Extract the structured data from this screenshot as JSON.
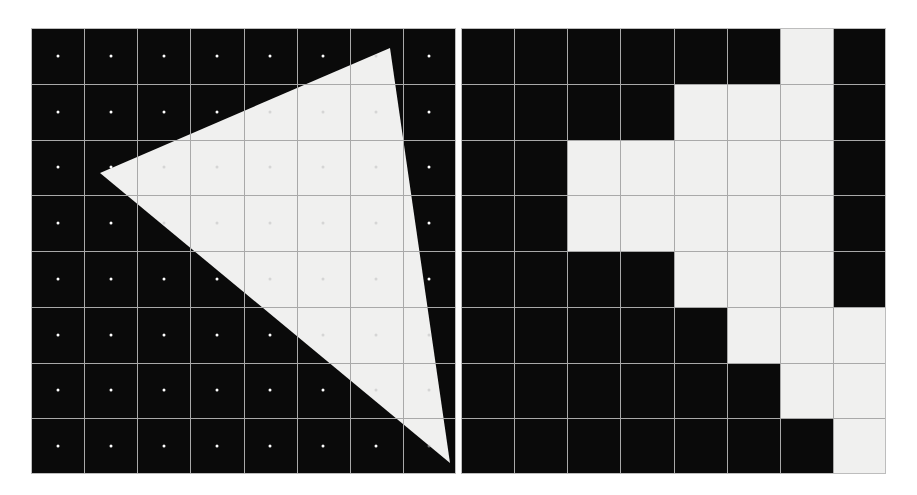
{
  "figure": {
    "width": 917,
    "height": 495,
    "background_color": "#ffffff"
  },
  "colors": {
    "cell_off": "#0a0a0a",
    "cell_on": "#f0f0ef",
    "gridline": "#a9a9a9",
    "sample_dot": "#ffffff",
    "shape_fill": "#f0f0ef",
    "panel_border": "#bdbdbd"
  },
  "panels": [
    {
      "id": "continuous",
      "name": "continuous-triangle-panel",
      "label": "Triangle over sample grid",
      "grid": {
        "columns": 8,
        "rows": 8
      },
      "shape": {
        "type": "triangle",
        "name": "triangle-overlay",
        "vertices_px": [
          [
            69,
            145
          ],
          [
            359,
            20
          ],
          [
            419,
            435
          ]
        ],
        "fill": "#f0f0ef"
      },
      "sample_points_visible": true
    },
    {
      "id": "raster",
      "name": "rasterized-grid-panel",
      "label": "Rasterized result",
      "grid": {
        "columns": 8,
        "rows": 8
      },
      "sample_points_visible": false
    }
  ],
  "chart_data": {
    "type": "heatmap",
    "xlabel": "column",
    "ylabel": "row",
    "grid": true,
    "legend": "none",
    "columns": 8,
    "rows": 8,
    "row_labels": [
      "0",
      "1",
      "2",
      "3",
      "4",
      "5",
      "6",
      "7"
    ],
    "column_labels": [
      "0",
      "1",
      "2",
      "3",
      "4",
      "5",
      "6",
      "7"
    ],
    "value_meaning": {
      "0": "sample outside triangle (black)",
      "1": "sample inside triangle (white)"
    },
    "coverage_matrix": [
      [
        0,
        0,
        0,
        0,
        0,
        0,
        1,
        0
      ],
      [
        0,
        0,
        0,
        0,
        1,
        1,
        1,
        0
      ],
      [
        0,
        0,
        1,
        1,
        1,
        1,
        1,
        0
      ],
      [
        0,
        0,
        1,
        1,
        1,
        1,
        1,
        0
      ],
      [
        0,
        0,
        0,
        0,
        1,
        1,
        1,
        0
      ],
      [
        0,
        0,
        0,
        0,
        0,
        1,
        1,
        1
      ],
      [
        0,
        0,
        0,
        0,
        0,
        0,
        1,
        1
      ],
      [
        0,
        0,
        0,
        0,
        0,
        0,
        0,
        1
      ]
    ],
    "covered_cell_count": 23,
    "total_cell_count": 64,
    "triangle_vertices_grid": [
      [
        1.3,
        2.6
      ],
      [
        6.75,
        0.36
      ],
      [
        7.88,
        7.8
      ]
    ]
  }
}
